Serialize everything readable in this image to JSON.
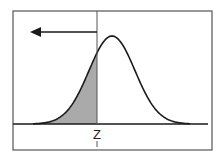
{
  "diagram": {
    "type": "normal-distribution-left-tail",
    "z_label": "Z",
    "colors": {
      "background": "#ffffff",
      "frame": "#555555",
      "curve": "#1a1a1a",
      "shade": "#aaaaaa",
      "arrow": "#1a1a1a"
    },
    "frame": {
      "x": 13,
      "y": 11,
      "w": 199,
      "h": 139
    },
    "baseline": {
      "y": 124,
      "x1": 13,
      "x2": 208
    },
    "curve": {
      "mean_x": 112,
      "sigma_px": 23,
      "peak_y": 36,
      "x_start": 33,
      "x_end": 190
    },
    "z_line": {
      "x": 97,
      "y_top": 11,
      "y_bottom": 124
    },
    "arrow": {
      "x_from": 97,
      "x_to": 30,
      "y": 32,
      "direction": "left"
    },
    "z_tick": {
      "x": 97,
      "y1": 141,
      "y2": 147
    }
  }
}
